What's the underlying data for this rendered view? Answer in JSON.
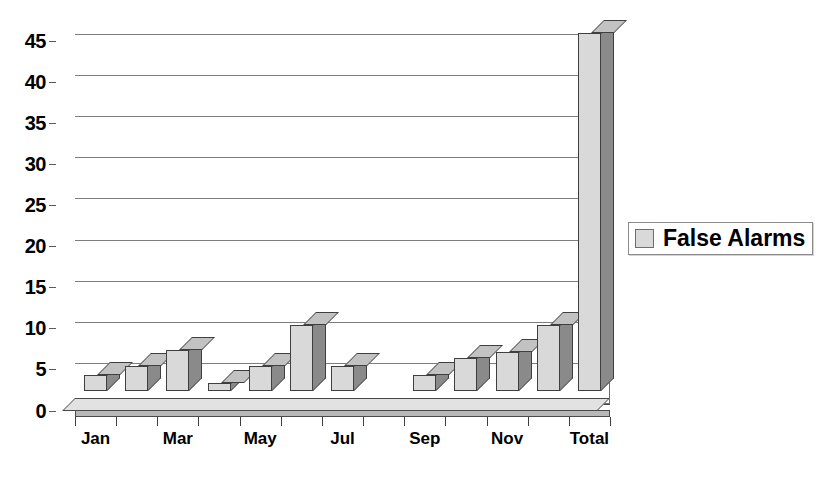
{
  "chart_data": {
    "type": "bar",
    "title": "",
    "subtitle": "",
    "xlabel": "",
    "ylabel": "",
    "categories": [
      "Jan",
      "Feb",
      "Mar",
      "Apr",
      "May",
      "Jun",
      "Jul",
      "Aug",
      "Sep",
      "Oct",
      "Nov",
      "Dec",
      "Total"
    ],
    "visible_tick_labels": [
      "Jan",
      "",
      "Mar",
      "",
      "May",
      "",
      "Jul",
      "",
      "Sep",
      "",
      "Nov",
      "",
      "Total"
    ],
    "series": [
      {
        "name": "False Alarms",
        "values": [
          2,
          3,
          5,
          1,
          3,
          8,
          3,
          0,
          2,
          4,
          4.7,
          8,
          43.5
        ],
        "color": "#d9d9d9",
        "side_color": "#8a8a8a",
        "top_color": "#c2c2c2",
        "edge_color": "#3f3f3f"
      }
    ],
    "ylim": [
      0,
      45
    ],
    "ytick_values": [
      0,
      5,
      10,
      15,
      20,
      25,
      30,
      35,
      40,
      45
    ],
    "ytick_labels": [
      "0",
      "5",
      "10",
      "15",
      "20",
      "25",
      "30",
      "35",
      "40",
      "45"
    ],
    "grid": true,
    "grid_axis": "y",
    "legend_position": "right",
    "legend_entries": [
      "False Alarms"
    ],
    "style": "3d-column",
    "background": "#ffffff"
  },
  "legend": {
    "items": [
      {
        "label": "False Alarms",
        "swatch_color": "#d9d9d9"
      }
    ]
  }
}
